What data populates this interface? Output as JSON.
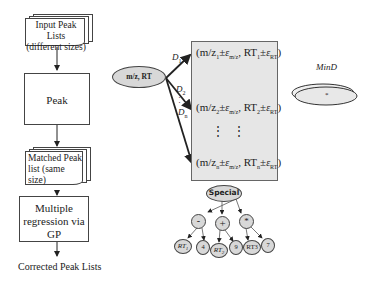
{
  "flowchart": {
    "input_doc": {
      "line1": "Input Peak Lists",
      "line2": "(different sizes)"
    },
    "peak_matching": "Peak Matching",
    "matched_doc": {
      "line1": "Matched Peak",
      "line2": "list (same",
      "line3": "size)"
    },
    "regression": {
      "line1": "Multiple",
      "line2": "regression via",
      "line3": "GP"
    },
    "output": "Corrected Peak Lists"
  },
  "matching_diagram": {
    "source_node": "m/z, RT",
    "edges": [
      {
        "label": "D",
        "sub": "1"
      },
      {
        "label": "D",
        "sub": "2"
      },
      {
        "label": "D",
        "sub": "n"
      }
    ],
    "tuples": [
      {
        "mz": "(m/z",
        "mz_sub": "1",
        "pm": "±",
        "eps": "ε",
        "eps_sub": "m/z",
        "rt": ", RT",
        "rt_sub": "1",
        "rt_pm": "±",
        "rt_eps": "ε",
        "rt_eps_sub": "RT",
        "close": ")"
      },
      {
        "mz": "(m/z",
        "mz_sub": "2",
        "pm": "±",
        "eps": "ε",
        "eps_sub": "m/z",
        "rt": ", RT",
        "rt_sub": "2",
        "rt_pm": "±",
        "rt_eps": "ε",
        "rt_eps_sub": "RT",
        "close": ")"
      },
      {
        "mz": "(m/z",
        "mz_sub": "n",
        "pm": "±",
        "eps": "ε",
        "eps_sub": "m/z",
        "rt": ", RT",
        "rt_sub": "n",
        "rt_pm": "±",
        "rt_eps": "ε",
        "rt_eps_sub": "RT",
        "close": ")"
      }
    ],
    "ellipsis": "⋮   ⋮"
  },
  "mind": {
    "label": "MinD",
    "marker": "*"
  },
  "gp_tree": {
    "root": "Special",
    "level1": [
      "-",
      "+",
      "*"
    ],
    "leaves": [
      {
        "text": "RT",
        "sub": "1"
      },
      {
        "text": "4",
        "sub": ""
      },
      {
        "text": "RT",
        "sub": "2"
      },
      {
        "text": "9",
        "sub": ""
      },
      {
        "text": "RT",
        "sub": "3"
      },
      {
        "text": "7",
        "sub": ""
      }
    ]
  },
  "colors": {
    "tuple_box_fill": "#e6e6e6",
    "node_fill": "#d8d8d8",
    "stroke": "#333333"
  }
}
